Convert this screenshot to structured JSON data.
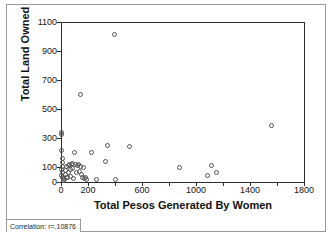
{
  "chart_data": {
    "type": "scatter",
    "title": "",
    "xlabel": "Total Pesos Generated By Women",
    "ylabel": "Total Land Owned",
    "xlim": [
      0,
      1800
    ],
    "ylim": [
      0,
      1100
    ],
    "grid": false,
    "legend": null,
    "marker": "open-circle",
    "x_ticks": [
      0,
      200,
      400,
      600,
      800,
      1000,
      1200,
      1400,
      1600,
      1800
    ],
    "x_tick_labels": [
      "0",
      "200",
      "",
      "600",
      "",
      "1000",
      "",
      "1400",
      "",
      "1800"
    ],
    "y_ticks": [
      0,
      100,
      300,
      500,
      700,
      900,
      1100
    ],
    "y_tick_labels": [
      "0",
      "100",
      "300",
      "500",
      "700",
      "900",
      "1100"
    ],
    "annotation": "Correlation: r=.10876",
    "points": [
      [
        5,
        340
      ],
      [
        8,
        320
      ],
      [
        10,
        210
      ],
      [
        12,
        160
      ],
      [
        14,
        130
      ],
      [
        16,
        105
      ],
      [
        10,
        85
      ],
      [
        14,
        60
      ],
      [
        8,
        40
      ],
      [
        16,
        25
      ],
      [
        20,
        20
      ],
      [
        24,
        10
      ],
      [
        30,
        15
      ],
      [
        34,
        45
      ],
      [
        38,
        75
      ],
      [
        42,
        30
      ],
      [
        46,
        100
      ],
      [
        52,
        25
      ],
      [
        58,
        60
      ],
      [
        62,
        110
      ],
      [
        68,
        120
      ],
      [
        72,
        80
      ],
      [
        76,
        35
      ],
      [
        82,
        115
      ],
      [
        88,
        125
      ],
      [
        92,
        90
      ],
      [
        96,
        20
      ],
      [
        104,
        200
      ],
      [
        112,
        120
      ],
      [
        118,
        60
      ],
      [
        124,
        110
      ],
      [
        130,
        115
      ],
      [
        138,
        70
      ],
      [
        145,
        600
      ],
      [
        150,
        100
      ],
      [
        158,
        45
      ],
      [
        166,
        30
      ],
      [
        172,
        95
      ],
      [
        180,
        20
      ],
      [
        188,
        25
      ],
      [
        196,
        15
      ],
      [
        230,
        200
      ],
      [
        270,
        15
      ],
      [
        330,
        140
      ],
      [
        345,
        245
      ],
      [
        400,
        1010
      ],
      [
        410,
        15
      ],
      [
        510,
        240
      ],
      [
        880,
        95
      ],
      [
        1090,
        40
      ],
      [
        1120,
        110
      ],
      [
        1155,
        65
      ],
      [
        1560,
        385
      ]
    ]
  },
  "figure": {
    "background_color": "#ffffff",
    "axis_color": "#2b2b2b",
    "marker_color": "#555555",
    "frame_color": "#9a9a9a"
  }
}
